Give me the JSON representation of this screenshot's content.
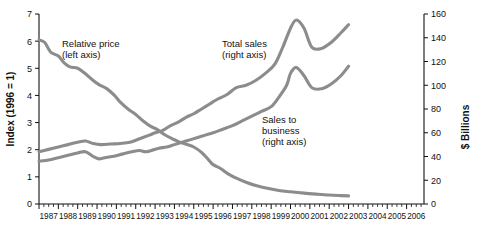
{
  "chart_data": {
    "type": "line",
    "title": "",
    "subtitle": "",
    "xlabel": "",
    "ylabel": "Index (1996 = 1)",
    "y2label": "$ Billions",
    "grid": false,
    "legend": "annotations-inline",
    "xlim": [
      1987,
      2006.9
    ],
    "ylim": [
      0,
      7
    ],
    "y2lim": [
      0,
      160
    ],
    "yticks": [
      0,
      1,
      2,
      3,
      4,
      5,
      6,
      7
    ],
    "y2ticks": [
      0,
      20,
      40,
      60,
      80,
      100,
      120,
      140,
      160
    ],
    "xticks": [
      1987,
      1988,
      1989,
      1990,
      1991,
      1992,
      1993,
      1994,
      1995,
      1996,
      1997,
      1998,
      1999,
      2000,
      2001,
      2002,
      2003,
      2004,
      2005,
      2006
    ],
    "minor_ticks_per_year": 4,
    "line_color": "#8c8c8c",
    "axis_color": "#111111",
    "annotations": [
      {
        "name": "relative-price-label",
        "line1": "Relative price",
        "line2": "(left axis)",
        "x": 62,
        "y": 47
      },
      {
        "name": "total-sales-label",
        "line1": "Total sales",
        "line2": "(right axis)",
        "x": 222,
        "y": 47
      },
      {
        "name": "sales-to-business-label",
        "line1": "Sales to",
        "line2": "business",
        "line3": "(right axis)",
        "x": 262,
        "y": 123
      }
    ],
    "series": [
      {
        "name": "Relative price (left axis)",
        "axis": "left",
        "units": "index, 1996 = 1",
        "x": [
          1987.0,
          1987.3,
          1987.6,
          1988.0,
          1988.3,
          1988.6,
          1989.0,
          1989.4,
          1989.8,
          1990.1,
          1990.5,
          1990.9,
          1991.2,
          1991.6,
          1992.0,
          1992.4,
          1992.8,
          1993.1,
          1993.5,
          1993.9,
          1994.2,
          1994.6,
          1995.0,
          1995.4,
          1995.8,
          1996.0,
          1996.4,
          1996.8,
          1997.2,
          1997.7,
          1998.2,
          1998.8,
          1999.4,
          2000.0,
          2000.7,
          2001.4,
          2002.0,
          2002.6,
          2003.0
        ],
        "y": [
          6.05,
          5.95,
          5.6,
          5.45,
          5.2,
          5.05,
          5.0,
          4.8,
          4.55,
          4.4,
          4.25,
          4.0,
          3.75,
          3.5,
          3.3,
          3.05,
          2.85,
          2.75,
          2.55,
          2.4,
          2.3,
          2.2,
          2.1,
          1.9,
          1.6,
          1.45,
          1.3,
          1.1,
          0.95,
          0.8,
          0.68,
          0.58,
          0.5,
          0.45,
          0.4,
          0.36,
          0.33,
          0.31,
          0.3
        ]
      },
      {
        "name": "Total sales (right axis)",
        "axis": "right",
        "units": "$ Billions",
        "x": [
          1987.0,
          1987.5,
          1988.0,
          1988.5,
          1989.0,
          1989.4,
          1989.8,
          1990.2,
          1990.7,
          1991.2,
          1991.7,
          1992.2,
          1992.7,
          1993.0,
          1993.4,
          1993.8,
          1994.2,
          1994.6,
          1995.0,
          1995.4,
          1995.8,
          1996.2,
          1996.7,
          1997.2,
          1997.7,
          1998.2,
          1998.7,
          1999.2,
          1999.6,
          2000.0,
          2000.3,
          2000.7,
          2001.1,
          2001.6,
          2002.1,
          2002.6,
          2003.0
        ],
        "y": [
          44,
          46,
          48,
          50,
          52,
          53,
          51,
          50,
          50.5,
          51,
          52,
          55,
          58,
          60,
          62,
          66,
          69,
          73,
          76,
          80,
          84,
          88,
          92,
          98,
          100,
          104,
          110,
          118,
          132,
          148,
          155,
          148,
          132,
          131,
          136,
          144,
          151
        ]
      },
      {
        "name": "Sales to business (right axis)",
        "axis": "right",
        "units": "$ Billions",
        "x": [
          1987.0,
          1987.5,
          1988.0,
          1988.5,
          1989.0,
          1989.4,
          1989.8,
          1990.1,
          1990.4,
          1990.8,
          1991.3,
          1991.8,
          1992.2,
          1992.5,
          1992.8,
          1993.2,
          1993.6,
          1994.0,
          1994.4,
          1994.8,
          1995.2,
          1995.6,
          1996.0,
          1996.5,
          1997.0,
          1997.5,
          1998.0,
          1998.5,
          1999.0,
          1999.4,
          1999.8,
          2000.0,
          2000.3,
          2000.7,
          2001.1,
          2001.6,
          2002.1,
          2002.6,
          2003.0
        ],
        "y": [
          36,
          37,
          39,
          41,
          43,
          44,
          40,
          38,
          39,
          40,
          42,
          44,
          45,
          44,
          45,
          47,
          48,
          50,
          52,
          54,
          56,
          58,
          60,
          63,
          66,
          70,
          74,
          78,
          82,
          90,
          100,
          110,
          115,
          108,
          98,
          97,
          101,
          108,
          116
        ]
      }
    ]
  }
}
